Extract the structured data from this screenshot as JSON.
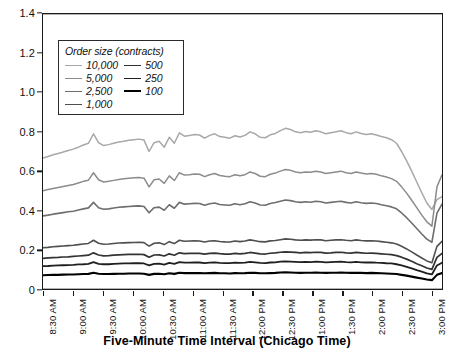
{
  "chart_data": {
    "type": "line",
    "title": "",
    "xlabel": "Five-Minute Time Interval (Chicago Time)",
    "ylabel": "",
    "ylim": [
      0,
      1.4
    ],
    "ytick_values": [
      0,
      0.2,
      0.4,
      0.6,
      0.8,
      1.0,
      1.2,
      1.4
    ],
    "ytick_labels": [
      "0",
      "0.2",
      "0.4",
      "0.6",
      "0.8",
      "1.0",
      "1.2",
      "1.4"
    ],
    "grid": true,
    "grid_axis": "y",
    "legend_position": "upper-left-inside",
    "legend_title": "Order size (contracts)",
    "xtick_labels": [
      "8:30 AM",
      "9:00 AM",
      "9:30 AM",
      "10:00 AM",
      "10:30 AM",
      "11:00 AM",
      "11:30 AM",
      "12:00 PM",
      "12:30 PM",
      "1:00 PM",
      "1:30 PM",
      "2:00 PM",
      "2:30 PM",
      "3:00 PM"
    ],
    "x_start": "8:30 AM",
    "x_end": "3:05 PM",
    "x_interval_minutes": 5,
    "n_points": 80,
    "series": [
      {
        "name": "10,000",
        "color": "#a8a8a8",
        "width": 1.5,
        "values": [
          0.667,
          0.675,
          0.683,
          0.69,
          0.697,
          0.705,
          0.712,
          0.722,
          0.733,
          0.742,
          0.79,
          0.745,
          0.73,
          0.735,
          0.742,
          0.748,
          0.752,
          0.757,
          0.76,
          0.763,
          0.758,
          0.7,
          0.745,
          0.752,
          0.722,
          0.772,
          0.742,
          0.795,
          0.778,
          0.782,
          0.786,
          0.784,
          0.768,
          0.782,
          0.79,
          0.776,
          0.772,
          0.768,
          0.78,
          0.774,
          0.782,
          0.8,
          0.79,
          0.772,
          0.77,
          0.785,
          0.792,
          0.806,
          0.818,
          0.812,
          0.8,
          0.796,
          0.802,
          0.798,
          0.806,
          0.8,
          0.79,
          0.796,
          0.8,
          0.806,
          0.796,
          0.79,
          0.8,
          0.792,
          0.786,
          0.79,
          0.784,
          0.776,
          0.77,
          0.76,
          0.742,
          0.7,
          0.652,
          0.6,
          0.545,
          0.49,
          0.438,
          0.405,
          0.455,
          0.47
        ]
      },
      {
        "name": "5,000",
        "color": "#8c8c8c",
        "width": 1.5,
        "values": [
          0.5,
          0.506,
          0.512,
          0.517,
          0.522,
          0.527,
          0.532,
          0.54,
          0.548,
          0.554,
          0.592,
          0.556,
          0.545,
          0.548,
          0.553,
          0.558,
          0.561,
          0.564,
          0.566,
          0.568,
          0.564,
          0.52,
          0.556,
          0.56,
          0.538,
          0.576,
          0.552,
          0.592,
          0.58,
          0.582,
          0.586,
          0.584,
          0.572,
          0.582,
          0.588,
          0.578,
          0.574,
          0.572,
          0.582,
          0.576,
          0.582,
          0.596,
          0.588,
          0.574,
          0.572,
          0.584,
          0.59,
          0.6,
          0.608,
          0.604,
          0.596,
          0.592,
          0.596,
          0.594,
          0.6,
          0.596,
          0.588,
          0.592,
          0.596,
          0.6,
          0.592,
          0.588,
          0.596,
          0.59,
          0.586,
          0.588,
          0.584,
          0.576,
          0.57,
          0.562,
          0.548,
          0.52,
          0.488,
          0.452,
          0.414,
          0.376,
          0.342,
          0.32,
          0.52,
          0.582
        ]
      },
      {
        "name": "2,500",
        "color": "#6e6e6e",
        "width": 1.6,
        "values": [
          0.372,
          0.376,
          0.381,
          0.385,
          0.389,
          0.393,
          0.396,
          0.402,
          0.408,
          0.413,
          0.441,
          0.414,
          0.406,
          0.408,
          0.412,
          0.416,
          0.418,
          0.42,
          0.422,
          0.423,
          0.42,
          0.388,
          0.414,
          0.417,
          0.401,
          0.429,
          0.411,
          0.441,
          0.432,
          0.434,
          0.436,
          0.435,
          0.426,
          0.434,
          0.438,
          0.43,
          0.428,
          0.426,
          0.434,
          0.429,
          0.434,
          0.444,
          0.438,
          0.428,
          0.426,
          0.435,
          0.44,
          0.447,
          0.453,
          0.45,
          0.444,
          0.441,
          0.444,
          0.442,
          0.447,
          0.444,
          0.438,
          0.441,
          0.444,
          0.447,
          0.441,
          0.438,
          0.444,
          0.439,
          0.436,
          0.438,
          0.435,
          0.429,
          0.424,
          0.418,
          0.408,
          0.387,
          0.363,
          0.336,
          0.308,
          0.28,
          0.254,
          0.238,
          0.386,
          0.432
        ]
      },
      {
        "name": "1,000",
        "color": "#4f4f4f",
        "width": 1.6,
        "values": [
          0.21,
          0.212,
          0.215,
          0.217,
          0.219,
          0.221,
          0.223,
          0.226,
          0.229,
          0.232,
          0.248,
          0.233,
          0.228,
          0.229,
          0.232,
          0.234,
          0.235,
          0.236,
          0.237,
          0.238,
          0.236,
          0.218,
          0.233,
          0.235,
          0.226,
          0.241,
          0.231,
          0.248,
          0.243,
          0.244,
          0.245,
          0.244,
          0.239,
          0.244,
          0.246,
          0.242,
          0.24,
          0.239,
          0.244,
          0.241,
          0.244,
          0.25,
          0.246,
          0.241,
          0.24,
          0.245,
          0.247,
          0.251,
          0.255,
          0.253,
          0.25,
          0.248,
          0.25,
          0.249,
          0.251,
          0.25,
          0.246,
          0.248,
          0.25,
          0.251,
          0.248,
          0.246,
          0.25,
          0.247,
          0.245,
          0.246,
          0.244,
          0.241,
          0.238,
          0.235,
          0.229,
          0.218,
          0.204,
          0.189,
          0.173,
          0.158,
          0.143,
          0.134,
          0.217,
          0.243
        ]
      },
      {
        "name": "500",
        "color": "#333333",
        "width": 1.7,
        "values": [
          0.156,
          0.158,
          0.16,
          0.161,
          0.163,
          0.164,
          0.166,
          0.168,
          0.17,
          0.172,
          0.184,
          0.173,
          0.169,
          0.17,
          0.172,
          0.174,
          0.175,
          0.176,
          0.176,
          0.177,
          0.175,
          0.162,
          0.173,
          0.174,
          0.168,
          0.179,
          0.172,
          0.184,
          0.18,
          0.181,
          0.182,
          0.181,
          0.178,
          0.181,
          0.183,
          0.18,
          0.178,
          0.178,
          0.181,
          0.179,
          0.181,
          0.186,
          0.183,
          0.179,
          0.178,
          0.182,
          0.184,
          0.187,
          0.189,
          0.188,
          0.186,
          0.184,
          0.186,
          0.185,
          0.187,
          0.186,
          0.183,
          0.184,
          0.186,
          0.187,
          0.184,
          0.183,
          0.186,
          0.184,
          0.182,
          0.183,
          0.181,
          0.179,
          0.177,
          0.175,
          0.17,
          0.162,
          0.152,
          0.141,
          0.129,
          0.118,
          0.107,
          0.1,
          0.161,
          0.181
        ]
      },
      {
        "name": "250",
        "color": "#1f1f1f",
        "width": 1.8,
        "values": [
          0.116,
          0.117,
          0.119,
          0.12,
          0.121,
          0.122,
          0.123,
          0.125,
          0.126,
          0.128,
          0.137,
          0.128,
          0.126,
          0.126,
          0.128,
          0.129,
          0.13,
          0.13,
          0.131,
          0.131,
          0.13,
          0.12,
          0.128,
          0.129,
          0.124,
          0.133,
          0.128,
          0.137,
          0.134,
          0.134,
          0.135,
          0.135,
          0.132,
          0.134,
          0.136,
          0.133,
          0.132,
          0.132,
          0.134,
          0.133,
          0.134,
          0.138,
          0.136,
          0.133,
          0.132,
          0.135,
          0.136,
          0.139,
          0.14,
          0.139,
          0.138,
          0.137,
          0.138,
          0.137,
          0.139,
          0.138,
          0.136,
          0.137,
          0.138,
          0.139,
          0.137,
          0.136,
          0.138,
          0.136,
          0.135,
          0.136,
          0.134,
          0.133,
          0.131,
          0.13,
          0.126,
          0.12,
          0.113,
          0.105,
          0.096,
          0.088,
          0.08,
          0.074,
          0.12,
          0.134
        ]
      },
      {
        "name": "100",
        "color": "#000000",
        "width": 2.1,
        "values": [
          0.07,
          0.071,
          0.072,
          0.072,
          0.073,
          0.074,
          0.074,
          0.075,
          0.076,
          0.077,
          0.083,
          0.078,
          0.076,
          0.076,
          0.077,
          0.078,
          0.078,
          0.079,
          0.079,
          0.079,
          0.078,
          0.072,
          0.077,
          0.078,
          0.075,
          0.08,
          0.077,
          0.083,
          0.081,
          0.081,
          0.081,
          0.081,
          0.08,
          0.081,
          0.082,
          0.08,
          0.08,
          0.079,
          0.081,
          0.08,
          0.081,
          0.083,
          0.082,
          0.08,
          0.08,
          0.081,
          0.082,
          0.084,
          0.085,
          0.084,
          0.083,
          0.082,
          0.083,
          0.083,
          0.084,
          0.083,
          0.082,
          0.083,
          0.083,
          0.084,
          0.083,
          0.082,
          0.083,
          0.082,
          0.081,
          0.082,
          0.081,
          0.08,
          0.079,
          0.078,
          0.076,
          0.072,
          0.068,
          0.063,
          0.058,
          0.053,
          0.048,
          0.045,
          0.072,
          0.081
        ]
      }
    ]
  },
  "legend": {
    "title": "Order size (contracts)",
    "column_left": [
      "10,000",
      "5,000",
      "2,500",
      "1,000"
    ],
    "column_right": [
      "500",
      "250",
      "100"
    ]
  },
  "axes": {
    "x_title": "Five-Minute Time Interval (Chicago Time)"
  },
  "colors": {
    "axis": "#1a1a1a",
    "gridline": "#555555",
    "background": "#ffffff"
  }
}
